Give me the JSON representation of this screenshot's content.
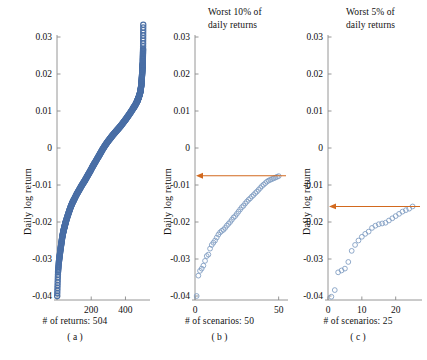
{
  "figure": {
    "width": 427,
    "height": 360,
    "background": "#ffffff",
    "marker_color_primary": "#4a6fa5",
    "marker_color_secondary": "#7d9bc1",
    "arrow_color": "#d2691e",
    "axis_color": "#8a8a8a"
  },
  "panels": [
    {
      "id": "a",
      "title": "",
      "ylabel": "Daily log return",
      "xcaption": "# of returns: 504",
      "subcaption": "( a )",
      "yticks": [
        "0.03",
        "0.02",
        "0.01",
        "0",
        "-0.01",
        "-0.02",
        "-0.03",
        "-0.04"
      ],
      "ytick_values": [
        0.03,
        0.02,
        0.01,
        0,
        -0.01,
        -0.02,
        -0.03,
        -0.04
      ],
      "xticks": [
        "200",
        "400"
      ],
      "xtick_values": [
        200,
        400
      ],
      "arrow": null
    },
    {
      "id": "b",
      "title": "Worst 10% of\ndaily returns",
      "ylabel": "Daily log return",
      "xcaption": "# of scenarios: 50",
      "subcaption": "( b )",
      "yticks": [
        "0.03",
        "0.02",
        "0.01",
        "0",
        "-0.01",
        "-0.02",
        "-0.03",
        "-0.04"
      ],
      "ytick_values": [
        0.03,
        0.02,
        0.01,
        0,
        -0.01,
        -0.02,
        -0.03,
        -0.04
      ],
      "xticks": [
        "0",
        "50"
      ],
      "xtick_values": [
        0,
        50
      ],
      "arrow": {
        "y_value": -0.0075,
        "label": ""
      }
    },
    {
      "id": "c",
      "title": "Worst 5% of\ndaily returns",
      "ylabel": "Daily log return",
      "xcaption": "# of scenarios: 25",
      "subcaption": "( c )",
      "yticks": [
        "0.03",
        "0.02",
        "0.01",
        "0",
        "-0.01",
        "-0.02",
        "-0.03",
        "-0.04"
      ],
      "ytick_values": [
        0.03,
        0.02,
        0.01,
        0,
        -0.01,
        -0.02,
        -0.03,
        -0.04
      ],
      "xticks": [
        "0",
        "10",
        "20"
      ],
      "xtick_values": [
        0,
        10,
        20
      ],
      "arrow": {
        "y_value": -0.0158,
        "label": ""
      }
    }
  ],
  "chart_data": [
    {
      "type": "scatter",
      "panel": "a",
      "title": "",
      "xlabel": "# of returns: 504",
      "ylabel": "Daily log return",
      "xlim": [
        0,
        504
      ],
      "ylim": [
        -0.042,
        0.034
      ],
      "grid": false,
      "legend": "none",
      "n_points": 504,
      "description": "Sorted daily log returns of 504 observations, ascending S-curve.",
      "x": [
        1,
        6,
        11,
        16,
        21,
        26,
        31,
        36,
        41,
        46,
        51,
        61,
        71,
        81,
        91,
        101,
        116,
        131,
        146,
        161,
        176,
        191,
        206,
        221,
        236,
        251,
        266,
        281,
        296,
        311,
        326,
        341,
        356,
        371,
        386,
        401,
        416,
        431,
        446,
        456,
        466,
        471,
        476,
        481,
        486,
        489,
        492,
        494,
        496,
        498,
        500,
        501,
        502,
        503,
        504
      ],
      "y": [
        -0.04,
        -0.0335,
        -0.0308,
        -0.029,
        -0.0272,
        -0.0256,
        -0.024,
        -0.0228,
        -0.0218,
        -0.0209,
        -0.02,
        -0.0185,
        -0.0171,
        -0.0158,
        -0.0147,
        -0.0138,
        -0.0124,
        -0.0112,
        -0.01,
        -0.0089,
        -0.0077,
        -0.0065,
        -0.0052,
        -0.004,
        -0.0028,
        -0.0016,
        -0.0004,
        0.0007,
        0.0017,
        0.0026,
        0.0035,
        0.0043,
        0.0051,
        0.0059,
        0.0068,
        0.0077,
        0.0087,
        0.0097,
        0.0108,
        0.0115,
        0.0124,
        0.0129,
        0.0135,
        0.0142,
        0.015,
        0.0158,
        0.0168,
        0.0178,
        0.0191,
        0.0205,
        0.0219,
        0.0228,
        0.0248,
        0.0268,
        0.0333
      ]
    },
    {
      "type": "scatter",
      "panel": "b",
      "title": "Worst 10% of daily returns",
      "xlabel": "# of scenarios: 50",
      "ylabel": "Daily log return",
      "xlim": [
        0,
        52
      ],
      "ylim": [
        -0.042,
        0.034
      ],
      "grid": false,
      "legend": "none",
      "n_points": 50,
      "description": "The 50 worst daily log returns sorted ascending; orange arrow marks the 10% VaR cut-off.",
      "annotation_arrow_y": -0.0075,
      "x": [
        1,
        2,
        3,
        4,
        5,
        6,
        7,
        8,
        9,
        10,
        11,
        12,
        13,
        14,
        15,
        16,
        17,
        18,
        19,
        20,
        21,
        22,
        23,
        24,
        25,
        26,
        27,
        28,
        29,
        30,
        31,
        32,
        33,
        34,
        35,
        36,
        37,
        38,
        39,
        40,
        41,
        42,
        43,
        44,
        45,
        46,
        47,
        48,
        49,
        50
      ],
      "y": [
        -0.04,
        -0.0345,
        -0.0332,
        -0.0326,
        -0.0318,
        -0.0305,
        -0.0292,
        -0.0288,
        -0.0272,
        -0.0262,
        -0.0256,
        -0.025,
        -0.0242,
        -0.0234,
        -0.0228,
        -0.0224,
        -0.0221,
        -0.0216,
        -0.021,
        -0.0205,
        -0.02,
        -0.0194,
        -0.0188,
        -0.0184,
        -0.0178,
        -0.0172,
        -0.0166,
        -0.016,
        -0.0156,
        -0.015,
        -0.0145,
        -0.014,
        -0.0136,
        -0.0131,
        -0.0127,
        -0.0122,
        -0.0118,
        -0.0113,
        -0.0108,
        -0.0103,
        -0.0099,
        -0.0095,
        -0.0091,
        -0.0088,
        -0.0086,
        -0.0084,
        -0.0082,
        -0.008,
        -0.0078,
        -0.0076
      ]
    },
    {
      "type": "scatter",
      "panel": "c",
      "title": "Worst 5% of daily returns",
      "xlabel": "# of scenarios: 25",
      "ylabel": "Daily log return",
      "xlim": [
        0,
        26
      ],
      "ylim": [
        -0.042,
        0.034
      ],
      "grid": false,
      "legend": "none",
      "n_points": 25,
      "description": "The 25 worst daily log returns sorted ascending; orange arrow marks the 5% VaR cut-off.",
      "annotation_arrow_y": -0.0158,
      "x": [
        1,
        2,
        3,
        4,
        5,
        6,
        7,
        8,
        9,
        10,
        11,
        12,
        13,
        14,
        15,
        16,
        17,
        18,
        19,
        20,
        21,
        22,
        23,
        24,
        25
      ],
      "y": [
        -0.0402,
        -0.0384,
        -0.0336,
        -0.0331,
        -0.0326,
        -0.0308,
        -0.0278,
        -0.0262,
        -0.025,
        -0.024,
        -0.0232,
        -0.0226,
        -0.0216,
        -0.021,
        -0.0206,
        -0.0204,
        -0.0202,
        -0.0196,
        -0.019,
        -0.0184,
        -0.0178,
        -0.0172,
        -0.0168,
        -0.0164,
        -0.0158
      ]
    }
  ]
}
